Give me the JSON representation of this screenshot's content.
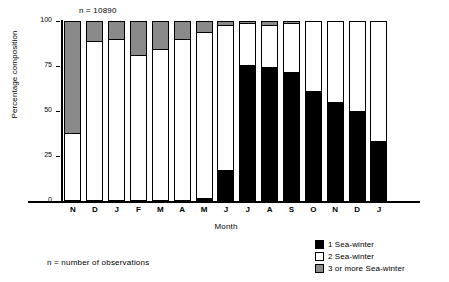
{
  "chart_data": {
    "type": "bar",
    "subtype": "stacked-percentage",
    "title": "",
    "xlabel": "Month",
    "ylabel": "Percentage composition",
    "ylim": [
      0,
      100
    ],
    "yticks": [
      0,
      25,
      50,
      75,
      100
    ],
    "ytick_labels": [
      "0",
      "25",
      "50",
      "75",
      "100"
    ],
    "grid": false,
    "legend_position": "bottom-right",
    "annotation": "n = 10890",
    "footnote": "n = number of observations",
    "categories": [
      "N",
      "D",
      "J",
      "F",
      "M",
      "A",
      "M",
      "J",
      "J",
      "A",
      "S",
      "O",
      "N",
      "D",
      "J"
    ],
    "series": [
      {
        "name": "1 Sea-winter",
        "color": "#000000",
        "values": [
          0,
          0,
          0,
          0,
          0,
          0,
          1,
          17,
          76,
          75,
          72,
          61,
          55,
          50,
          33
        ]
      },
      {
        "name": "2 Sea-winter",
        "color": "#ffffff",
        "values": [
          37,
          89,
          90,
          81,
          84,
          90,
          93,
          81,
          23,
          23,
          27,
          39,
          45,
          50,
          67
        ]
      },
      {
        "name": "3 or more Sea-winter",
        "color": "#8a8a8a",
        "values": [
          63,
          11,
          10,
          19,
          16,
          10,
          6,
          2,
          1,
          2,
          1,
          0,
          0,
          0,
          0
        ]
      }
    ],
    "stack_tops": {
      "three_or_more_bottom_pct": [
        37,
        89,
        90,
        81,
        84,
        90,
        94,
        98,
        99,
        98,
        99,
        100,
        100,
        100,
        100
      ],
      "one_sea_winter_top_pct": [
        0,
        0,
        0,
        0,
        0,
        0,
        1,
        17,
        76,
        75,
        72,
        61,
        55,
        50,
        33
      ]
    }
  },
  "legend": {
    "items": [
      {
        "label": "1 Sea-winter",
        "color": "#000000"
      },
      {
        "label": "2 Sea-winter",
        "color": "#ffffff"
      },
      {
        "label": "3 or more Sea-winter",
        "color": "#8a8a8a"
      }
    ]
  }
}
